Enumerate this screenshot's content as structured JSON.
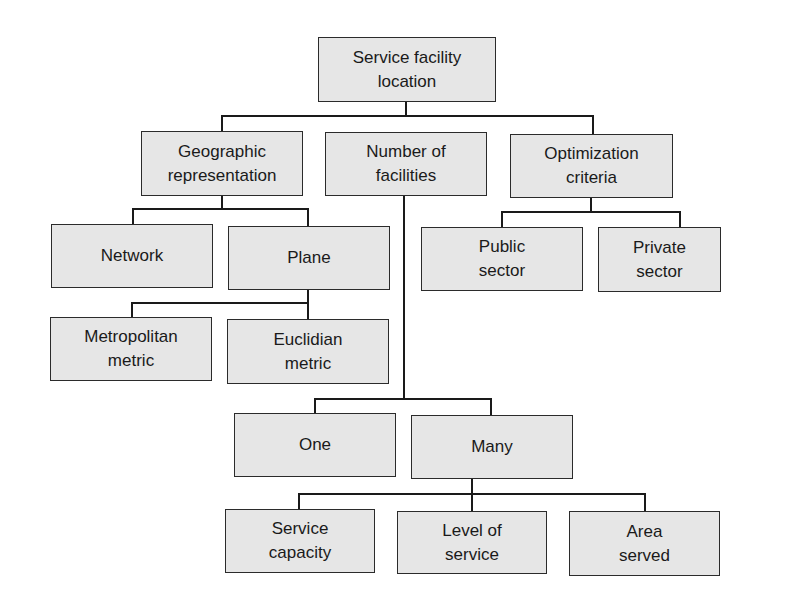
{
  "diagram": {
    "type": "hierarchy-tree",
    "colors": {
      "box_fill": "#e6e6e6",
      "box_border": "#2b2b2b",
      "connector": "#1a1a1a",
      "background": "#ffffff"
    },
    "nodes": {
      "root": {
        "label": "Service facility\nlocation"
      },
      "geographic": {
        "label": "Geographic\nrepresentation",
        "parent": "root"
      },
      "number": {
        "label": "Number of\nfacilities",
        "parent": "root"
      },
      "optimization": {
        "label": "Optimization\ncriteria",
        "parent": "root"
      },
      "network": {
        "label": "Network",
        "parent": "geographic"
      },
      "plane": {
        "label": "Plane",
        "parent": "geographic"
      },
      "metropolitan": {
        "label": "Metropolitan\nmetric",
        "parent": "plane"
      },
      "euclidian": {
        "label": "Euclidian\nmetric",
        "parent": "plane"
      },
      "public": {
        "label": "Public\nsector",
        "parent": "optimization"
      },
      "private": {
        "label": "Private\nsector",
        "parent": "optimization"
      },
      "one": {
        "label": "One",
        "parent": "number"
      },
      "many": {
        "label": "Many",
        "parent": "number"
      },
      "capacity": {
        "label": "Service\ncapacity",
        "parent": "many"
      },
      "level": {
        "label": "Level of\nservice",
        "parent": "many"
      },
      "area": {
        "label": "Area\nserved",
        "parent": "many"
      }
    }
  }
}
